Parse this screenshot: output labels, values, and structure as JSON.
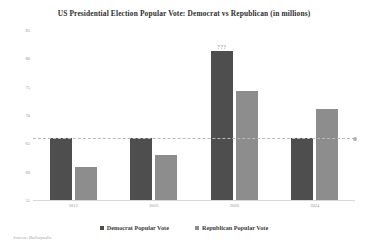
{
  "chart_data": {
    "type": "bar",
    "title": "US Presidential Election Popular Vote: Democrat vs Republican (in millions)",
    "xlabel": "",
    "ylabel": "",
    "categories": [
      "2012",
      "2016",
      "2020",
      "2024"
    ],
    "series": [
      {
        "name": "Democrat Popular Vote",
        "color": "#4e4e4e",
        "values": [
          65.9,
          65.9,
          81.3,
          65.9
        ]
      },
      {
        "name": "Republican Popular Vote",
        "color": "#8d8d8d",
        "values": [
          60.9,
          63.0,
          74.2,
          71.0
        ]
      }
    ],
    "ylim": [
      55,
      85
    ],
    "yticks": [
      "85",
      "80",
      "75",
      "70",
      "65",
      "60",
      "55"
    ],
    "grid": false,
    "legend_position": "bottom",
    "annotations": [
      {
        "series": "Democrat Popular Vote",
        "category": "2020",
        "text": "???"
      }
    ],
    "reference_line": {
      "value": 65.9,
      "style": "dashed",
      "color": "#b9b9b9",
      "marker": "circle"
    }
  },
  "source_note": "Source: Ballotpedia",
  "legend": {
    "items": [
      {
        "label": "Democrat Popular Vote",
        "color": "#4e4e4e"
      },
      {
        "label": "Republican Popular Vote",
        "color": "#8d8d8d"
      }
    ]
  }
}
